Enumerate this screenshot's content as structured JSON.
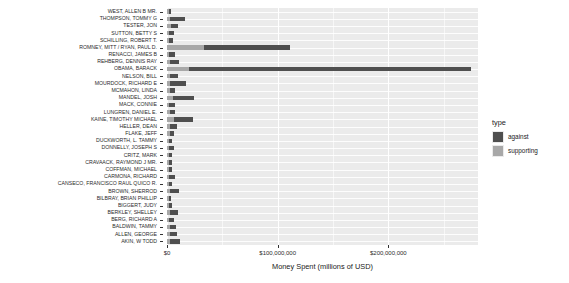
{
  "chart_data": {
    "type": "bar",
    "orientation": "horizontal",
    "stacked": true,
    "title": "",
    "xlabel": "Money Spent (millions of USD)",
    "ylabel": "",
    "xlim": [
      0,
      281000000
    ],
    "xticks": [
      0,
      100000000,
      200000000
    ],
    "xticklabels": [
      "$0",
      "$100,000,000",
      "$200,000,000"
    ],
    "grid": true,
    "legend": {
      "title": "type",
      "position": "right",
      "entries": [
        {
          "label": "against",
          "color": "#4f4f4f"
        },
        {
          "label": "supporting",
          "color": "#a8a8a8"
        }
      ]
    },
    "categories": [
      "WEST, ALLEN B MR.",
      "THOMPSON, TOMMY G",
      "TESTER, JON",
      "SUTTON, BETTY S",
      "SCHILLING, ROBERT T.",
      "ROMNEY, MITT / RYAN, PAUL D.",
      "RENACCI, JAMES B",
      "REHBERG, DENNIS RAY",
      "OBAMA, BARACK",
      "NELSON, BILL",
      "MOURDOCK, RICHARD E",
      "MCMAHON, LINDA",
      "MANDEL, JOSH",
      "MACK, CONNIE",
      "LUNGREN, DANIEL E.",
      "KAINE, TIMOTHY MICHAEL",
      "HELLER, DEAN",
      "FLAKE, JEFF",
      "DUCKWORTH, L. TAMMY",
      "DONNELLY, JOSEPH S",
      "CRITZ, MARK",
      "CRAVAACK, RAYMOND J MR.",
      "COFFMAN, MICHAEL",
      "CARMONA, RICHARD",
      "CANSECO, FRANCISCO RAUL QUICO R.",
      "BROWN, SHERROD",
      "BILBRAY, BRIAN PHILLIP",
      "BIGGERT, JUDY",
      "BERKLEY, SHELLEY",
      "BERG, RICHARD A",
      "BALDWIN, TAMMY",
      "ALLEN, GEORGE",
      "AKIN, W TODD"
    ],
    "series": [
      {
        "name": "supporting",
        "color": "#a8a8a8",
        "values": [
          1800000,
          2300000,
          3200000,
          2100000,
          2100000,
          33000000,
          2100000,
          2700000,
          20000000,
          2400000,
          3000000,
          2400000,
          5500000,
          2100000,
          2400000,
          6500000,
          2700000,
          2400000,
          1700000,
          1500000,
          1400000,
          1400000,
          1500000,
          1800000,
          1500000,
          2700000,
          1400000,
          1400000,
          2400000,
          1500000,
          2400000,
          2400000,
          2400000
        ]
      },
      {
        "name": "against",
        "color": "#4f4f4f",
        "values": [
          2000000,
          14000000,
          7200000,
          4000000,
          3200000,
          78000000,
          4800000,
          8500000,
          255000000,
          8000000,
          14000000,
          5200000,
          19000000,
          4800000,
          4400000,
          17000000,
          6000000,
          3800000,
          2800000,
          4400000,
          3200000,
          2800000,
          3200000,
          5500000,
          3200000,
          8500000,
          2400000,
          2800000,
          7200000,
          4400000,
          6000000,
          6500000,
          9500000
        ]
      }
    ]
  }
}
